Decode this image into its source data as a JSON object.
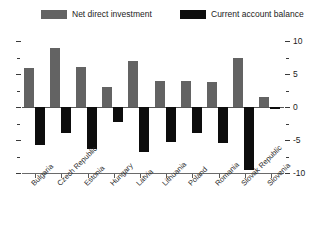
{
  "legend": {
    "position": "top",
    "entries": [
      {
        "label": "Net direct investment",
        "color": "#636363"
      },
      {
        "label": "Current account balance",
        "color": "#0d0d0d"
      }
    ]
  },
  "axis": {
    "y_ticks": [
      "10",
      "5",
      "0",
      "-5",
      "-10"
    ],
    "y_min": -10,
    "y_max": 10
  },
  "chart_data": {
    "type": "bar",
    "title": "",
    "subtitle": "",
    "xlabel": "",
    "ylabel": "",
    "ylim": [
      -10,
      10
    ],
    "grid": false,
    "legend_position": "top",
    "ytick_labels": [
      "10",
      "5",
      "0",
      "-5",
      "-10"
    ],
    "ytick_values": [
      10,
      5,
      0,
      -5,
      -10
    ],
    "minor_ticks": true,
    "categories": [
      "Bulgaria",
      "Czech Republic",
      "Estonia",
      "Hungary",
      "Latvia",
      "Lithuania",
      "Poland",
      "Romania",
      "Slovak Republic",
      "Slovenia"
    ],
    "series": [
      {
        "name": "Net direct investment",
        "color": "#636363",
        "values": [
          5.9,
          9.0,
          6.0,
          3.0,
          7.0,
          4.0,
          4.0,
          3.8,
          7.5,
          1.5
        ]
      },
      {
        "name": "Current account balance",
        "color": "#0d0d0d",
        "values": [
          -5.8,
          -4.0,
          -6.3,
          -2.3,
          -6.8,
          -5.3,
          -4.0,
          -5.5,
          -9.5,
          -0.3
        ]
      }
    ]
  }
}
